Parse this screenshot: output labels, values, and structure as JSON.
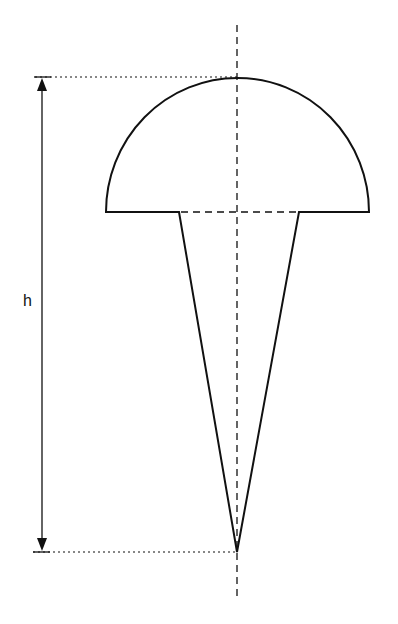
{
  "diagram": {
    "labels": {
      "height": "h"
    },
    "geometry": {
      "axis_x": 237,
      "axis_top_y": 25,
      "axis_bottom_y": 600,
      "hemisphere_top_y": 78,
      "hemisphere_base_y": 212,
      "hemisphere_left_x": 106,
      "hemisphere_right_x": 369,
      "cone_left_x": 179,
      "cone_right_x": 299,
      "cone_tip_y": 552,
      "dimension_line_x": 42
    },
    "colors": {
      "stroke": "#111111",
      "background": "#ffffff"
    }
  }
}
